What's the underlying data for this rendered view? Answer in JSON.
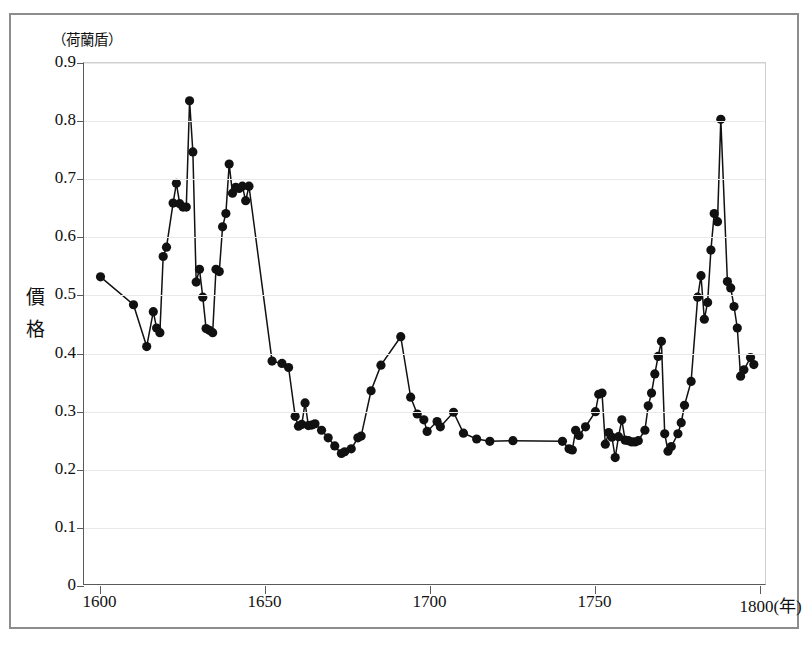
{
  "chart_data": {
    "type": "line",
    "title": "",
    "subtitle": "",
    "xlabel": "年",
    "ylabel": "價格",
    "unit_label": "（荷蘭盾）",
    "x_axis_suffix": "(年)",
    "xlim": [
      1595,
      1802
    ],
    "ylim": [
      0,
      0.9
    ],
    "xticks": [
      1600,
      1650,
      1700,
      1750,
      1800
    ],
    "xtick_labels": [
      "1600",
      "1650",
      "1700",
      "1750",
      "1800(年)"
    ],
    "yticks": [
      0,
      0.1,
      0.2,
      0.3,
      0.4,
      0.5,
      0.6,
      0.7,
      0.8,
      0.9
    ],
    "ytick_labels": [
      "0",
      "0.1",
      "0.2",
      "0.3",
      "0.4",
      "0.5",
      "0.6",
      "0.7",
      "0.8",
      "0.9"
    ],
    "grid": "horizontal",
    "legend": "none",
    "marker": "filled-circle",
    "marker_color": "#111111",
    "line_color": "#111111",
    "series": [
      {
        "name": "價格",
        "points": [
          [
            1600,
            0.532
          ],
          [
            1610,
            0.484
          ],
          [
            1614,
            0.412
          ],
          [
            1616,
            0.472
          ],
          [
            1617,
            0.444
          ],
          [
            1618,
            0.436
          ],
          [
            1619,
            0.567
          ],
          [
            1620,
            0.583
          ],
          [
            1622,
            0.659
          ],
          [
            1623,
            0.693
          ],
          [
            1624,
            0.658
          ],
          [
            1625,
            0.652
          ],
          [
            1626,
            0.652
          ],
          [
            1627,
            0.835
          ],
          [
            1628,
            0.747
          ],
          [
            1629,
            0.523
          ],
          [
            1630,
            0.545
          ],
          [
            1631,
            0.497
          ],
          [
            1632,
            0.443
          ],
          [
            1633,
            0.44
          ],
          [
            1634,
            0.436
          ],
          [
            1635,
            0.545
          ],
          [
            1636,
            0.541
          ],
          [
            1637,
            0.618
          ],
          [
            1638,
            0.641
          ],
          [
            1639,
            0.726
          ],
          [
            1640,
            0.676
          ],
          [
            1641,
            0.686
          ],
          [
            1642,
            0.684
          ],
          [
            1643,
            0.688
          ],
          [
            1644,
            0.663
          ],
          [
            1645,
            0.688
          ],
          [
            1652,
            0.387
          ],
          [
            1655,
            0.383
          ],
          [
            1657,
            0.376
          ],
          [
            1659,
            0.292
          ],
          [
            1660,
            0.275
          ],
          [
            1661,
            0.278
          ],
          [
            1662,
            0.315
          ],
          [
            1663,
            0.276
          ],
          [
            1664,
            0.277
          ],
          [
            1665,
            0.279
          ],
          [
            1667,
            0.268
          ],
          [
            1669,
            0.255
          ],
          [
            1671,
            0.241
          ],
          [
            1673,
            0.228
          ],
          [
            1674,
            0.231
          ],
          [
            1676,
            0.236
          ],
          [
            1678,
            0.255
          ],
          [
            1679,
            0.258
          ],
          [
            1682,
            0.336
          ],
          [
            1685,
            0.38
          ],
          [
            1691,
            0.429
          ],
          [
            1694,
            0.325
          ],
          [
            1696,
            0.296
          ],
          [
            1698,
            0.286
          ],
          [
            1699,
            0.266
          ],
          [
            1702,
            0.283
          ],
          [
            1703,
            0.274
          ],
          [
            1707,
            0.299
          ],
          [
            1710,
            0.263
          ],
          [
            1714,
            0.253
          ],
          [
            1718,
            0.249
          ],
          [
            1725,
            0.25
          ],
          [
            1740,
            0.249
          ],
          [
            1742,
            0.236
          ],
          [
            1743,
            0.234
          ],
          [
            1744,
            0.268
          ],
          [
            1745,
            0.259
          ],
          [
            1747,
            0.274
          ],
          [
            1750,
            0.3
          ],
          [
            1751,
            0.33
          ],
          [
            1752,
            0.332
          ],
          [
            1753,
            0.244
          ],
          [
            1754,
            0.264
          ],
          [
            1755,
            0.256
          ],
          [
            1756,
            0.221
          ],
          [
            1757,
            0.257
          ],
          [
            1758,
            0.286
          ],
          [
            1759,
            0.251
          ],
          [
            1760,
            0.25
          ],
          [
            1761,
            0.248
          ],
          [
            1762,
            0.248
          ],
          [
            1763,
            0.25
          ],
          [
            1765,
            0.268
          ],
          [
            1766,
            0.31
          ],
          [
            1767,
            0.332
          ],
          [
            1768,
            0.365
          ],
          [
            1769,
            0.395
          ],
          [
            1770,
            0.421
          ],
          [
            1771,
            0.262
          ],
          [
            1772,
            0.232
          ],
          [
            1773,
            0.24
          ],
          [
            1775,
            0.262
          ],
          [
            1776,
            0.281
          ],
          [
            1777,
            0.311
          ],
          [
            1779,
            0.352
          ],
          [
            1781,
            0.497
          ],
          [
            1782,
            0.534
          ],
          [
            1783,
            0.459
          ],
          [
            1784,
            0.488
          ],
          [
            1785,
            0.578
          ],
          [
            1786,
            0.641
          ],
          [
            1787,
            0.627
          ],
          [
            1788,
            0.803
          ],
          [
            1790,
            0.524
          ],
          [
            1791,
            0.513
          ],
          [
            1792,
            0.481
          ],
          [
            1793,
            0.444
          ],
          [
            1794,
            0.361
          ],
          [
            1795,
            0.372
          ],
          [
            1797,
            0.393
          ],
          [
            1798,
            0.381
          ]
        ]
      }
    ]
  }
}
